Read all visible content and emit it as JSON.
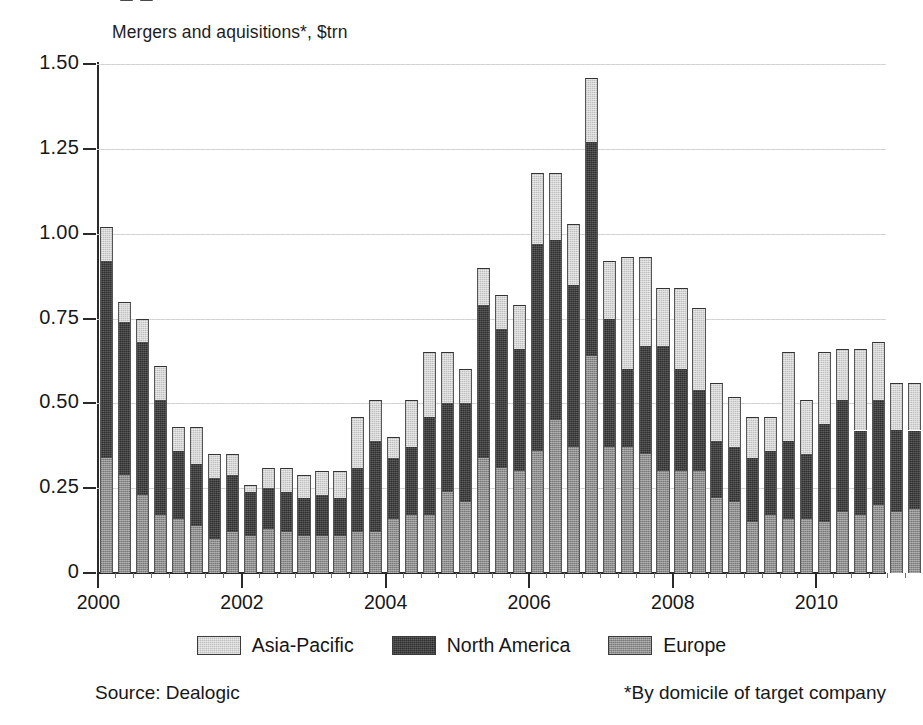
{
  "chart_data": {
    "type": "bar",
    "subtype": "stacked-vertical",
    "title": "Mergers and aquisitions*, $trn",
    "xlabel": "",
    "ylabel": "",
    "ylim": [
      0,
      1.5
    ],
    "yticks": [
      0,
      0.25,
      0.5,
      0.75,
      1.0,
      1.25,
      1.5
    ],
    "ytick_labels": [
      "0",
      "0.25",
      "0.50",
      "0.75",
      "1.00",
      "1.25",
      "1.50"
    ],
    "xtick_labels": [
      "2000",
      "2002",
      "2004",
      "2006",
      "2008",
      "2010",
      "2012"
    ],
    "xtick_years": [
      2000,
      2002,
      2004,
      2006,
      2008,
      2010,
      2012
    ],
    "x_minor": "quarterly",
    "grid": "horizontal-dotted",
    "legend_position": "bottom-center",
    "categories": [
      "2000 Q1",
      "2000 Q2",
      "2000 Q3",
      "2000 Q4",
      "2001 Q1",
      "2001 Q2",
      "2001 Q3",
      "2001 Q4",
      "2002 Q1",
      "2002 Q2",
      "2002 Q3",
      "2002 Q4",
      "2003 Q1",
      "2003 Q2",
      "2003 Q3",
      "2003 Q4",
      "2004 Q1",
      "2004 Q2",
      "2004 Q3",
      "2004 Q4",
      "2005 Q1",
      "2005 Q2",
      "2005 Q3",
      "2005 Q4",
      "2006 Q1",
      "2006 Q2",
      "2006 Q3",
      "2006 Q4",
      "2007 Q1",
      "2007 Q2",
      "2007 Q3",
      "2007 Q4",
      "2008 Q1",
      "2008 Q2",
      "2008 Q3",
      "2008 Q4",
      "2009 Q1",
      "2009 Q2",
      "2009 Q3",
      "2009 Q4",
      "2010 Q1",
      "2010 Q2",
      "2010 Q3",
      "2010 Q4",
      "2011 Q1",
      "2011 Q2",
      "2011 Q3",
      "2011 Q4",
      "2012 Q1",
      "2012 Q2"
    ],
    "series": [
      {
        "name": "Europe",
        "color": "#8f8f8f",
        "stack_order": 0,
        "values": [
          0.34,
          0.29,
          0.23,
          0.17,
          0.16,
          0.14,
          0.1,
          0.12,
          0.11,
          0.13,
          0.12,
          0.11,
          0.11,
          0.11,
          0.12,
          0.12,
          0.16,
          0.17,
          0.17,
          0.24,
          0.21,
          0.34,
          0.31,
          0.3,
          0.36,
          0.45,
          0.37,
          0.64,
          0.37,
          0.37,
          0.35,
          0.3,
          0.3,
          0.3,
          0.22,
          0.21,
          0.15,
          0.17,
          0.16,
          0.16,
          0.15,
          0.18,
          0.17,
          0.2,
          0.18,
          0.19,
          0.16,
          0.12,
          0.13,
          0.24
        ]
      },
      {
        "name": "North America",
        "color": "#2e2e2e",
        "stack_order": 1,
        "values": [
          0.58,
          0.45,
          0.45,
          0.34,
          0.2,
          0.18,
          0.18,
          0.17,
          0.13,
          0.12,
          0.12,
          0.11,
          0.12,
          0.11,
          0.19,
          0.27,
          0.18,
          0.2,
          0.29,
          0.26,
          0.29,
          0.45,
          0.41,
          0.36,
          0.61,
          0.53,
          0.48,
          0.63,
          0.38,
          0.23,
          0.32,
          0.37,
          0.3,
          0.24,
          0.17,
          0.16,
          0.19,
          0.19,
          0.23,
          0.19,
          0.29,
          0.33,
          0.25,
          0.31,
          0.24,
          0.23,
          0.26,
          0.26,
          0.24,
          0.41
        ]
      },
      {
        "name": "Asia-Pacific",
        "color": "#d5d5d5",
        "stack_order": 2,
        "values": [
          0.1,
          0.06,
          0.07,
          0.1,
          0.07,
          0.11,
          0.07,
          0.06,
          0.02,
          0.06,
          0.07,
          0.07,
          0.07,
          0.08,
          0.15,
          0.12,
          0.06,
          0.14,
          0.19,
          0.15,
          0.1,
          0.11,
          0.1,
          0.13,
          0.21,
          0.2,
          0.18,
          0.19,
          0.17,
          0.33,
          0.26,
          0.17,
          0.24,
          0.24,
          0.17,
          0.15,
          0.12,
          0.1,
          0.26,
          0.16,
          0.21,
          0.15,
          0.24,
          0.17,
          0.14,
          0.14,
          0.14,
          0.13,
          0.14,
          0.16
        ]
      }
    ]
  },
  "legend": {
    "items": [
      {
        "label": "Asia-Pacific",
        "color": "#d5d5d5"
      },
      {
        "label": "North America",
        "color": "#2e2e2e"
      },
      {
        "label": "Europe",
        "color": "#8f8f8f"
      }
    ]
  },
  "footer": {
    "source": "Source: Dealogic",
    "footnote": "*By domicile of target company"
  }
}
